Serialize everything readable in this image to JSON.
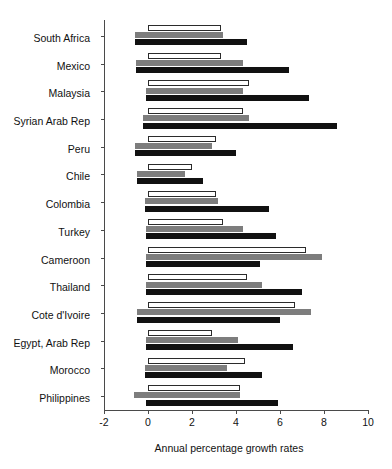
{
  "chart_data": {
    "type": "bar",
    "orientation": "horizontal",
    "title": "",
    "xlabel": "Annual percentage growth rates",
    "ylabel": "",
    "xlim": [
      -2,
      10
    ],
    "xticks": [
      -2,
      0,
      2,
      4,
      6,
      8,
      10
    ],
    "xticklabels": [
      "-2",
      "0",
      "2",
      "4",
      "6",
      "8",
      "10"
    ],
    "grid": false,
    "legend": "none",
    "categories": [
      "South Africa",
      "Mexico",
      "Malaysia",
      "Syrian Arab Rep",
      "Peru",
      "Chile",
      "Colombia",
      "Turkey",
      "Cameroon",
      "Thailand",
      "Cote d'Ivoire",
      "Egypt, Arab Rep",
      "Morocco",
      "Philippines"
    ],
    "series": [
      {
        "name": "white",
        "color": "#ffffff",
        "values": [
          3.3,
          3.3,
          4.6,
          4.3,
          3.1,
          2.0,
          3.1,
          3.4,
          7.2,
          4.5,
          6.7,
          2.9,
          4.4,
          4.2
        ]
      },
      {
        "name": "gray",
        "color": "#7d7d7d",
        "values": [
          3.4,
          4.3,
          4.3,
          4.6,
          2.9,
          1.7,
          3.2,
          4.3,
          7.9,
          5.2,
          7.4,
          4.1,
          3.6,
          4.2
        ]
      },
      {
        "name": "black",
        "color": "#111111",
        "values": [
          4.5,
          6.4,
          7.3,
          8.6,
          4.0,
          2.5,
          5.5,
          5.8,
          5.1,
          7.0,
          6.0,
          6.6,
          5.2,
          5.9
        ]
      }
    ],
    "negative_starts": {
      "white": [
        0,
        0,
        0,
        0,
        0,
        0,
        0,
        0,
        0,
        0,
        0,
        0,
        0,
        0
      ],
      "gray": [
        -0.6,
        -0.55,
        -0.1,
        -0.25,
        -0.6,
        -0.5,
        -0.15,
        -0.1,
        -0.1,
        -0.1,
        -0.5,
        -0.1,
        -0.15,
        -0.65
      ],
      "black": [
        -0.6,
        -0.55,
        -0.1,
        -0.25,
        -0.6,
        -0.5,
        -0.15,
        -0.1,
        -0.1,
        -0.1,
        -0.5,
        -0.1,
        -0.15,
        -0.1
      ]
    }
  }
}
